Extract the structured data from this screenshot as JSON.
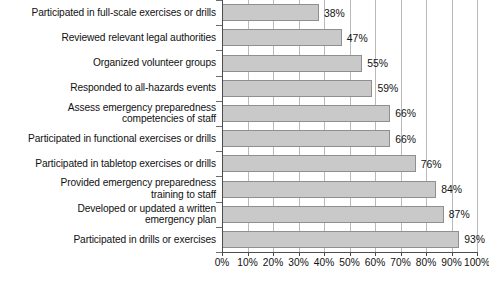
{
  "chart_data": {
    "type": "bar",
    "orientation": "horizontal",
    "title": "",
    "subtitle": "",
    "xlabel": "",
    "ylabel": "",
    "xlim": [
      0,
      100
    ],
    "xtick_labels": [
      "0%",
      "10%",
      "20%",
      "30%",
      "40%",
      "50%",
      "60%",
      "70%",
      "80%",
      "90%",
      "100%"
    ],
    "xtick_values": [
      0,
      10,
      20,
      30,
      40,
      50,
      60,
      70,
      80,
      90,
      100
    ],
    "grid": "vertical",
    "legend": "none",
    "categories": [
      "Participated in full-scale exercises or drills",
      "Reviewed relevant legal authorities",
      "Organized volunteer groups",
      "Responded to all-hazards events",
      "Assess emergency preparedness\ncompetencies of staff",
      "Participated in functional exercises or drills",
      "Participated in tabletop exercises or drills",
      "Provided emergency preparedness\ntraining to staff",
      "Developed or updated a written\nemergency plan",
      "Participated in drills or exercises"
    ],
    "values": [
      38,
      47,
      55,
      59,
      66,
      66,
      76,
      84,
      87,
      93
    ],
    "value_labels": [
      "38%",
      "47%",
      "55%",
      "59%",
      "66%",
      "66%",
      "76%",
      "84%",
      "87%",
      "93%"
    ],
    "colors": {
      "bar_fill": "#c9c9c9",
      "bar_border": "#8f8f8f",
      "gridline": "#b9b9b9",
      "axis": "#4d4d4d",
      "text": "#111111",
      "background": "#ffffff"
    }
  }
}
